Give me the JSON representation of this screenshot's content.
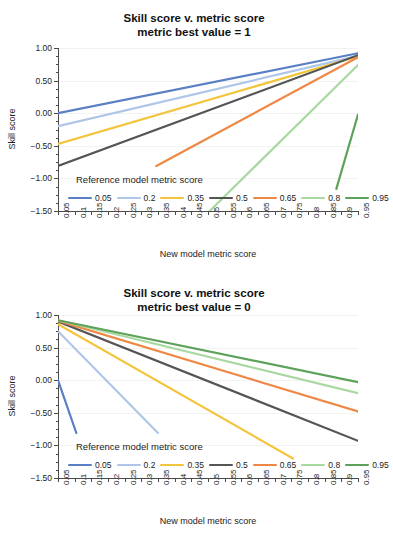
{
  "page": {
    "background": "#ffffff",
    "axis_color": "#4a4a4a",
    "grid_color": "#f2f2f2"
  },
  "series_colors": {
    "0.05": "#5b7fc4",
    "0.2": "#aec6e8",
    "0.35": "#f2c53d",
    "0.5": "#555555",
    "0.65": "#ee8844",
    "0.8": "#a8d9a0",
    "0.95": "#5da25a"
  },
  "legend": {
    "title": "Reference model metric score",
    "entries": [
      {
        "label": "0.05",
        "color": "#5b7fc4"
      },
      {
        "label": "0.2",
        "color": "#aec6e8"
      },
      {
        "label": "0.35",
        "color": "#f2c53d"
      },
      {
        "label": "0.5",
        "color": "#555555"
      },
      {
        "label": "0.65",
        "color": "#ee8844"
      },
      {
        "label": "0.8",
        "color": "#a8d9a0"
      },
      {
        "label": "0.95",
        "color": "#5da25a"
      }
    ]
  },
  "axes": {
    "ylabel": "Skill score",
    "xlabel": "New model metric score",
    "ytick_labels": [
      "1.00",
      "0.50",
      "0.00",
      "−0.50",
      "−1.00",
      "−1.50"
    ],
    "ytick_values": [
      1.0,
      0.5,
      0.0,
      -0.5,
      -1.0,
      -1.5
    ],
    "ylim": [
      -1.5,
      1.0
    ],
    "xlim": [
      0.05,
      0.95
    ],
    "xtick_labels": [
      "0.05",
      "0.1",
      "0.15",
      "0.2",
      "0.25",
      "0.3",
      "0.35",
      "0.4",
      "0.45",
      "0.5",
      "0.55",
      "0.6",
      "0.65",
      "0.7",
      "0.75",
      "0.8",
      "0.85",
      "0.9",
      "0.95"
    ],
    "xtick_values": [
      0.05,
      0.1,
      0.15,
      0.2,
      0.25,
      0.3,
      0.35,
      0.4,
      0.45,
      0.5,
      0.55,
      0.6,
      0.65,
      0.7,
      0.75,
      0.8,
      0.85,
      0.9,
      0.95
    ]
  },
  "chart_data": [
    {
      "type": "line",
      "title": "Skill score v. metric score",
      "subtitle": "metric best value = 1",
      "xlabel": "New model metric score",
      "ylabel": "Skill score",
      "xlim": [
        0.05,
        0.95
      ],
      "ylim": [
        -1.5,
        1.0
      ],
      "grid": true,
      "legend_position": "inside-bottom",
      "legend_title": "Reference model metric score",
      "x": [
        0.05,
        0.1,
        0.15,
        0.2,
        0.25,
        0.3,
        0.35,
        0.4,
        0.45,
        0.5,
        0.55,
        0.6,
        0.65,
        0.7,
        0.75,
        0.8,
        0.85,
        0.9,
        0.95
      ],
      "series": [
        {
          "name": "0.05",
          "color": "#5b7fc4",
          "values": [
            0.0,
            0.108,
            0.216,
            0.315,
            0.404,
            0.485,
            0.557,
            0.62,
            0.675,
            0.723,
            0.764,
            0.798,
            0.827,
            0.851,
            0.871,
            0.888,
            0.901,
            0.911,
            0.92
          ]
        },
        {
          "name": "0.2",
          "color": "#aec6e8",
          "values": [
            -0.199,
            -0.074,
            0.041,
            0.146,
            0.242,
            0.328,
            0.404,
            0.471,
            0.529,
            0.578,
            0.622,
            0.658,
            0.689,
            0.714,
            0.735,
            0.753,
            0.767,
            0.778,
            0.787
          ]
        },
        {
          "name": "0.35",
          "color": "#f2c53d",
          "values": [
            -0.467,
            -0.301,
            -0.147,
            -0.006,
            0.123,
            0.238,
            0.34,
            0.43,
            0.507,
            0.573,
            0.631,
            0.68,
            0.721,
            0.755,
            0.783,
            0.807,
            0.826,
            0.841,
            0.853
          ]
        },
        {
          "name": "0.5",
          "color": "#555555",
          "values": [
            -0.802,
            -0.588,
            -0.389,
            -0.207,
            -0.04,
            0.109,
            0.241,
            0.357,
            0.457,
            0.542,
            0.617,
            0.68,
            0.733,
            0.777,
            0.813,
            0.844,
            0.868,
            0.888,
            0.903
          ]
        },
        {
          "name": "0.65",
          "color": "#ee8844",
          "values": [
            -2.14,
            -1.73,
            -1.35,
            -1.0,
            -0.69,
            -0.4,
            -0.15,
            0.07,
            0.27,
            0.43,
            0.57,
            0.69,
            0.79,
            0.88,
            0.95,
            1.0,
            1.05,
            1.08,
            1.11
          ]
        },
        {
          "name": "0.8",
          "color": "#a8d9a0",
          "values": [
            -4.76,
            -3.96,
            -3.22,
            -2.54,
            -1.92,
            -1.37,
            -0.88,
            -0.45,
            -0.08,
            0.23,
            0.49,
            0.71,
            0.89,
            1.02,
            1.12,
            1.19,
            1.24,
            1.27,
            1.29
          ]
        },
        {
          "name": "0.95",
          "color": "#5da25a",
          "values": [
            -18.0,
            -15.0,
            -12.3,
            -9.93,
            -7.87,
            -6.04,
            -4.5,
            -3.22,
            -2.2,
            -1.45,
            -0.9,
            -0.5,
            -0.2,
            -0.04,
            0.05,
            0.1,
            0.12,
            0.13,
            0.14
          ]
        }
      ]
    },
    {
      "type": "line",
      "title": "Skill score v. metric score",
      "subtitle": "metric best value = 0",
      "xlabel": "New model metric score",
      "ylabel": "Skill score",
      "xlim": [
        0.05,
        0.95
      ],
      "ylim": [
        -1.5,
        1.0
      ],
      "grid": true,
      "legend_position": "inside-bottom",
      "legend_title": "Reference model metric score",
      "x": [
        0.05,
        0.1,
        0.15,
        0.2,
        0.25,
        0.3,
        0.35,
        0.4,
        0.45,
        0.5,
        0.55,
        0.6,
        0.65,
        0.7,
        0.75,
        0.8,
        0.85,
        0.9,
        0.95
      ],
      "series": [
        {
          "name": "0.05",
          "color": "#5b7fc4",
          "values": [
            0.0,
            -1.0,
            -3.5,
            -7.0,
            -11.5,
            -17.0,
            -23.5,
            -31.0,
            -39.5,
            -49.0,
            -59.5,
            -71.0,
            -83.5,
            -97.0,
            -111.5,
            -127.0,
            -143.5,
            -161.0,
            -179.5
          ]
        },
        {
          "name": "0.2",
          "color": "#aec6e8",
          "values": [
            0.75,
            0.5,
            0.21,
            -0.12,
            -0.49,
            -0.9,
            -1.35,
            -1.84,
            -2.37,
            -2.94,
            -3.55,
            -4.2,
            -4.89,
            -5.62,
            -6.39,
            -7.2,
            -8.05,
            -8.94,
            -9.87
          ]
        },
        {
          "name": "0.35",
          "color": "#f2c53d",
          "values": [
            0.86,
            0.8,
            0.73,
            0.65,
            0.56,
            0.45,
            0.33,
            0.2,
            0.05,
            -0.11,
            -0.29,
            -0.47,
            -0.68,
            -0.89,
            -1.12,
            -1.37,
            -1.62,
            -1.89,
            -2.18
          ]
        },
        {
          "name": "0.5",
          "color": "#555555",
          "values": [
            0.9,
            0.88,
            0.86,
            0.83,
            0.8,
            0.76,
            0.71,
            0.66,
            0.6,
            0.53,
            0.46,
            0.39,
            0.3,
            0.21,
            0.11,
            0.0,
            -0.11,
            -0.24,
            -0.37
          ]
        },
        {
          "name": "0.65",
          "color": "#ee8844",
          "values": [
            0.91,
            0.9,
            0.89,
            0.87,
            0.85,
            0.83,
            0.8,
            0.77,
            0.73,
            0.69,
            0.65,
            0.6,
            0.55,
            0.5,
            0.44,
            0.38,
            0.31,
            0.24,
            0.17
          ]
        },
        {
          "name": "0.8",
          "color": "#a8d9a0",
          "values": [
            0.92,
            0.91,
            0.91,
            0.9,
            0.89,
            0.88,
            0.87,
            0.85,
            0.84,
            0.82,
            0.8,
            0.77,
            0.75,
            0.72,
            0.69,
            0.66,
            0.63,
            0.59,
            0.56
          ]
        },
        {
          "name": "0.95",
          "color": "#5da25a",
          "values": [
            0.92,
            0.92,
            0.91,
            0.91,
            0.9,
            0.9,
            0.89,
            0.88,
            0.87,
            0.86,
            0.85,
            0.84,
            0.83,
            0.81,
            0.8,
            0.78,
            0.76,
            0.74,
            0.72
          ]
        }
      ]
    }
  ],
  "rendered_lines": {
    "top": [
      {
        "name": "0.05",
        "color": "#5b7fc4",
        "x1": 0.05,
        "y1": 0.0,
        "x2": 0.95,
        "y2": 0.92
      },
      {
        "name": "0.2",
        "color": "#aec6e8",
        "x1": 0.05,
        "y1": -0.2,
        "x2": 0.95,
        "y2": 0.88
      },
      {
        "name": "0.35",
        "color": "#f2c53d",
        "x1": 0.05,
        "y1": -0.47,
        "x2": 0.95,
        "y2": 0.87
      },
      {
        "name": "0.5",
        "color": "#555555",
        "x1": 0.05,
        "y1": -0.81,
        "x2": 0.95,
        "y2": 0.89
      },
      {
        "name": "0.65",
        "color": "#ee8844",
        "x1": 0.345,
        "y1": -0.81,
        "x2": 0.95,
        "y2": 0.86
      },
      {
        "name": "0.8",
        "color": "#a8d9a0",
        "x1": 0.505,
        "y1": -1.5,
        "x2": 0.95,
        "y2": 0.74
      },
      {
        "name": "0.95",
        "color": "#5da25a",
        "x1": 0.885,
        "y1": -1.16,
        "x2": 0.95,
        "y2": -0.02
      }
    ],
    "bottom": [
      {
        "name": "0.05",
        "color": "#5b7fc4",
        "x1": 0.05,
        "y1": 0.0,
        "x2": 0.105,
        "y2": -0.81
      },
      {
        "name": "0.2",
        "color": "#aec6e8",
        "x1": 0.05,
        "y1": 0.75,
        "x2": 0.35,
        "y2": -0.81
      },
      {
        "name": "0.35",
        "color": "#f2c53d",
        "x1": 0.05,
        "y1": 0.86,
        "x2": 0.755,
        "y2": -1.2
      },
      {
        "name": "0.5",
        "color": "#555555",
        "x1": 0.05,
        "y1": 0.9,
        "x2": 0.95,
        "y2": -0.93
      },
      {
        "name": "0.65",
        "color": "#ee8844",
        "x1": 0.05,
        "y1": 0.91,
        "x2": 0.95,
        "y2": -0.48
      },
      {
        "name": "0.8",
        "color": "#a8d9a0",
        "x1": 0.05,
        "y1": 0.92,
        "x2": 0.95,
        "y2": -0.2
      },
      {
        "name": "0.95",
        "color": "#5da25a",
        "x1": 0.05,
        "y1": 0.92,
        "x2": 0.95,
        "y2": -0.03
      }
    ]
  }
}
